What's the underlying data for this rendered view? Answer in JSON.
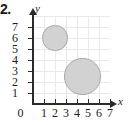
{
  "problem": {
    "number_label": "2."
  },
  "figure": {
    "y_axis_name": "y",
    "x_axis_name": "x",
    "origin_label": "0"
  },
  "chart_data": {
    "type": "scatter",
    "title": "",
    "xlabel": "x",
    "ylabel": "y",
    "xlim": [
      0,
      7
    ],
    "ylim": [
      0,
      7
    ],
    "grid": true,
    "legend": null,
    "x_ticks": [
      1,
      2,
      3,
      4,
      5,
      6,
      7
    ],
    "y_ticks": [
      1,
      2,
      3,
      4,
      5,
      6,
      7
    ],
    "x_tick_labels": [
      "1",
      "2",
      "3",
      "4",
      "5",
      "6",
      "7"
    ],
    "y_tick_labels": [
      "1",
      "2",
      "3",
      "4",
      "5",
      "6",
      "7"
    ],
    "origin_label": "0",
    "shapes": [
      {
        "name": "small-circle",
        "type": "circle",
        "center_x": 2.0,
        "center_y": 6.0,
        "radius": 1.15,
        "fill": "#d2d2d2",
        "stroke": "#a8a8a8"
      },
      {
        "name": "large-circle",
        "type": "circle",
        "center_x": 4.5,
        "center_y": 2.5,
        "radius": 1.65,
        "fill": "#d2d2d2",
        "stroke": "#a8a8a8"
      }
    ]
  }
}
